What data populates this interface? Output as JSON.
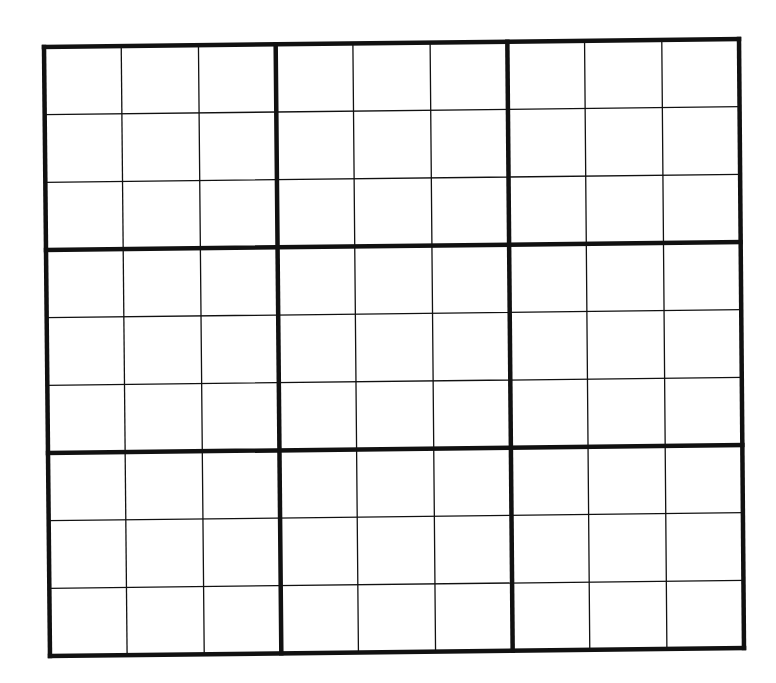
{
  "puzzle": {
    "type": "sudoku",
    "size": 9,
    "box_size": 3,
    "colors": {
      "background": "#ffffff",
      "grid_line": "#111111"
    },
    "cells": [
      [
        "",
        "",
        "",
        "",
        "",
        "",
        "",
        "",
        ""
      ],
      [
        "",
        "",
        "",
        "",
        "",
        "",
        "",
        "",
        ""
      ],
      [
        "",
        "",
        "",
        "",
        "",
        "",
        "",
        "",
        ""
      ],
      [
        "",
        "",
        "",
        "",
        "",
        "",
        "",
        "",
        ""
      ],
      [
        "",
        "",
        "",
        "",
        "",
        "",
        "",
        "",
        ""
      ],
      [
        "",
        "",
        "",
        "",
        "",
        "",
        "",
        "",
        ""
      ],
      [
        "",
        "",
        "",
        "",
        "",
        "",
        "",
        "",
        ""
      ],
      [
        "",
        "",
        "",
        "",
        "",
        "",
        "",
        "",
        ""
      ],
      [
        "",
        "",
        "",
        "",
        "",
        "",
        "",
        "",
        ""
      ]
    ]
  }
}
